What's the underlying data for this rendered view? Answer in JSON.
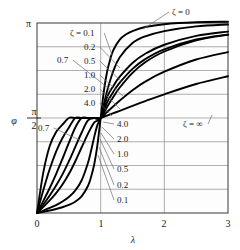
{
  "chart_data": {
    "type": "line",
    "title": "",
    "xlabel": "λ",
    "ylabel": "φ",
    "xlim": [
      0,
      3
    ],
    "ylim": [
      0,
      3.14159
    ],
    "grid": true,
    "legend_position": "inline-annotations",
    "x_ticks": [
      "0",
      "1",
      "2",
      "3"
    ],
    "x_tick_values": [
      0,
      1,
      2,
      3
    ],
    "y_ticks": [
      "0",
      "π/2",
      "π"
    ],
    "y_tick_values": [
      0,
      1.5708,
      3.14159
    ],
    "convergence_point": [
      1,
      1.5708
    ],
    "series": [
      {
        "name": "ζ = 0.1",
        "zeta": 0.1,
        "x": [
          0,
          0.1,
          0.2,
          0.3,
          0.4,
          0.5,
          0.6,
          0.7,
          0.8,
          0.85,
          0.9,
          0.95,
          1,
          1.05,
          1.1,
          1.15,
          1.2,
          1.3,
          1.4,
          1.5,
          1.7,
          2,
          2.5,
          3
        ],
        "y": [
          0,
          0.0202,
          0.0417,
          0.0659,
          0.0952,
          0.1333,
          0.1873,
          0.2748,
          0.4461,
          0.6002,
          0.8098,
          1.1298,
          1.5708,
          2.0118,
          2.3318,
          2.5414,
          2.6955,
          2.8668,
          2.9543,
          3.0083,
          3.0749,
          3.122,
          3.1528,
          3.1626
        ]
      },
      {
        "name": "ζ = 0.2",
        "zeta": 0.2,
        "x": [
          0,
          0.1,
          0.2,
          0.3,
          0.4,
          0.5,
          0.6,
          0.7,
          0.8,
          0.85,
          0.9,
          0.95,
          1,
          1.05,
          1.1,
          1.2,
          1.3,
          1.5,
          1.7,
          2,
          2.5,
          3
        ],
        "y": [
          0,
          0.0404,
          0.0833,
          0.1316,
          0.1896,
          0.2651,
          0.3709,
          0.5372,
          0.8278,
          1.0323,
          1.2626,
          1.4564,
          1.5708,
          1.7944,
          2.0144,
          2.3518,
          2.5746,
          2.8102,
          2.92,
          3.0079,
          3.0856,
          3.1164
        ]
      },
      {
        "name": "ζ = 0.5",
        "zeta": 0.5,
        "x": [
          0,
          0.1,
          0.2,
          0.3,
          0.4,
          0.5,
          0.6,
          0.7,
          0.8,
          0.9,
          1,
          1.1,
          1.2,
          1.3,
          1.5,
          1.7,
          2,
          2.5,
          3
        ],
        "y": [
          0,
          0.101,
          0.2082,
          0.3283,
          0.4706,
          0.6435,
          0.852,
          1.083,
          1.3078,
          1.4994,
          1.5708,
          1.9158,
          2.1015,
          2.2534,
          2.4805,
          2.6334,
          2.7819,
          2.9284,
          2.9998
        ]
      },
      {
        "name": "ζ = 0.7",
        "zeta": 0.7,
        "x": [
          0,
          0.1,
          0.2,
          0.3,
          0.4,
          0.5,
          0.6,
          0.7,
          0.8,
          0.9,
          1,
          1.1,
          1.2,
          1.3,
          1.5,
          1.7,
          2,
          2.5,
          3
        ],
        "y": [
          0,
          0.1412,
          0.2903,
          0.4538,
          0.6391,
          0.852,
          1.0891,
          1.3268,
          1.5313,
          1.5708,
          1.5708,
          1.8271,
          2.0054,
          2.154,
          2.3835,
          2.5448,
          2.7055,
          2.8685,
          2.9502
        ]
      },
      {
        "name": "ζ = 1.0",
        "zeta": 1.0,
        "x": [
          0,
          0.1,
          0.2,
          0.3,
          0.4,
          0.5,
          0.6,
          0.7,
          0.8,
          0.9,
          1,
          1.1,
          1.2,
          1.3,
          1.5,
          1.7,
          2,
          2.5,
          3
        ],
        "y": [
          0,
          0.2013,
          0.4129,
          0.6435,
          0.8961,
          1.1593,
          1.4101,
          1.5708,
          1.5708,
          1.5708,
          1.5708,
          1.7515,
          1.9222,
          2.0748,
          2.3182,
          2.4936,
          2.6704,
          2.8541,
          2.9483
        ]
      },
      {
        "name": "ζ = 2.0",
        "zeta": 2.0,
        "x": [
          0,
          0.1,
          0.2,
          0.3,
          0.4,
          0.5,
          0.6,
          0.7,
          0.8,
          0.9,
          1,
          1.1,
          1.2,
          1.3,
          1.5,
          1.7,
          2,
          2.5,
          3
        ],
        "y": [
          0,
          0.3805,
          0.7266,
          1.015,
          1.2399,
          1.4101,
          1.5708,
          1.5708,
          1.5708,
          1.5708,
          1.5708,
          1.669,
          1.7646,
          1.8593,
          2.0302,
          2.1724,
          2.336,
          2.5377,
          2.661
        ]
      },
      {
        "name": "ζ = 4.0",
        "zeta": 4.0,
        "x": [
          0,
          0.1,
          0.2,
          0.3,
          0.4,
          0.5,
          0.6,
          0.7,
          0.8,
          0.9,
          1,
          1.1,
          1.2,
          1.3,
          1.5,
          1.7,
          2,
          2.5,
          3
        ],
        "y": [
          0,
          0.6747,
          1.1071,
          1.3397,
          1.4601,
          1.5708,
          1.5708,
          1.5708,
          1.5708,
          1.5708,
          1.5708,
          1.61,
          1.6499,
          1.6901,
          1.7707,
          1.8493,
          1.9626,
          2.1324,
          2.2606
        ]
      }
    ],
    "annotations": [
      {
        "text": "ζ = 0",
        "x_px": 172,
        "y_px": 15,
        "leader_to_px": [
          143,
          29
        ]
      },
      {
        "text": "ζ = ∞",
        "x_px": 183,
        "y_px": 127,
        "leader_to_px": [
          212,
          115
        ]
      },
      {
        "text": "ζ = 0.1",
        "x_px": 70,
        "y_px": 36,
        "leader_to_px": [
          112,
          55
        ]
      },
      {
        "text": "0.2",
        "x_px": 84,
        "y_px": 50,
        "leader_to_px": [
          120,
          68
        ]
      },
      {
        "text": "0.5",
        "x_px": 84,
        "y_px": 64,
        "leader_to_px": [
          123,
          83
        ]
      },
      {
        "text": "0.7",
        "x_px": 57,
        "y_px": 63,
        "leader_to_px": [
          112,
          91
        ]
      },
      {
        "text": "1.0",
        "x_px": 84,
        "y_px": 78,
        "leader_to_px": [
          124,
          97
        ]
      },
      {
        "text": "2.0",
        "x_px": 84,
        "y_px": 92,
        "leader_to_px": [
          120,
          109
        ]
      },
      {
        "text": "4.0",
        "x_px": 84,
        "y_px": 106,
        "leader_to_px": [
          112,
          116
        ]
      },
      {
        "text": "0.7",
        "x_px": 38,
        "y_px": 131,
        "leader_to_px": [
          86,
          143
        ]
      },
      {
        "text": "4.0",
        "x_px": 117,
        "y_px": 127,
        "leader_to_px": [
          103,
          122
        ]
      },
      {
        "text": "2.0",
        "x_px": 117,
        "y_px": 142,
        "leader_to_px": [
          102,
          127
        ]
      },
      {
        "text": "1.0",
        "x_px": 117,
        "y_px": 157,
        "leader_to_px": [
          101,
          133
        ]
      },
      {
        "text": "0.5",
        "x_px": 117,
        "y_px": 172,
        "leader_to_px": [
          100,
          139
        ]
      },
      {
        "text": "0.2",
        "x_px": 117,
        "y_px": 188,
        "leader_to_px": [
          99,
          147
        ]
      },
      {
        "text": "0.1",
        "x_px": 117,
        "y_px": 203,
        "leader_to_px": [
          98,
          155
        ]
      }
    ]
  },
  "axes": {
    "y_top_label": "π",
    "y_mid_numerator": "π",
    "y_mid_denominator": "2",
    "y_zero_label": "0",
    "y_axis_symbol": "φ",
    "x_axis_symbol": "λ",
    "x_labels": [
      "0",
      "1",
      "2",
      "3"
    ]
  },
  "colors": {
    "curve": "#000000",
    "grid": "#8d8d8d",
    "frame": "#4a4a4a",
    "background": "#ffffff",
    "text": "#1a1a1a"
  }
}
